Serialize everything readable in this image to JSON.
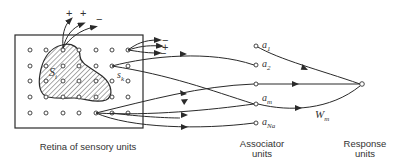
{
  "labels": {
    "retina": "Retina of sensory units",
    "associator_line1": "Associator",
    "associator_line2": "units",
    "response_line1": "Response",
    "response_line2": "units"
  },
  "symbols": {
    "s_i": "S",
    "s_i_sub": "i",
    "s_k": "s",
    "s_k_sub": "k",
    "w_m": "W",
    "w_m_sub": "m"
  },
  "signs_top": [
    "+",
    "+",
    "−"
  ],
  "signs_right": [
    "−",
    "+",
    "−"
  ],
  "associator_units": [
    {
      "name": "a",
      "sub": "1"
    },
    {
      "name": "a",
      "sub": "2"
    },
    {
      "name": "",
      "sub": ""
    },
    {
      "name": "a",
      "sub": "m"
    },
    {
      "name": "a",
      "sub": "Na"
    }
  ],
  "grid": {
    "cols": 7,
    "rows": 5
  },
  "colors": {
    "line": "#2a2a2a",
    "hatch": "#555555"
  }
}
